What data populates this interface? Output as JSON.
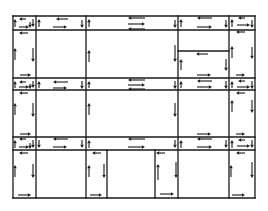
{
  "diagram": {
    "type": "block-circulation-flow",
    "canvas": {
      "width": 268,
      "height": 211,
      "background": "#ffffff",
      "ink": "#1a1a1a"
    },
    "grid": {
      "verticals_x": [
        13,
        36,
        86,
        178,
        229,
        255
      ],
      "horizontals_y": [
        16,
        30,
        78,
        90,
        137,
        150,
        198
      ]
    },
    "walls": [
      {
        "x1": 13,
        "y1": 16,
        "x2": 255,
        "y2": 16
      },
      {
        "x1": 13,
        "y1": 30,
        "x2": 255,
        "y2": 30
      },
      {
        "x1": 13,
        "y1": 78,
        "x2": 255,
        "y2": 78
      },
      {
        "x1": 13,
        "y1": 90,
        "x2": 255,
        "y2": 90
      },
      {
        "x1": 13,
        "y1": 137,
        "x2": 255,
        "y2": 137
      },
      {
        "x1": 13,
        "y1": 150,
        "x2": 255,
        "y2": 150
      },
      {
        "x1": 13,
        "y1": 198,
        "x2": 255,
        "y2": 198
      },
      {
        "x1": 13,
        "y1": 16,
        "x2": 13,
        "y2": 198
      },
      {
        "x1": 36,
        "y1": 16,
        "x2": 36,
        "y2": 198
      },
      {
        "x1": 86,
        "y1": 16,
        "x2": 86,
        "y2": 198
      },
      {
        "x1": 178,
        "y1": 16,
        "x2": 178,
        "y2": 198
      },
      {
        "x1": 229,
        "y1": 16,
        "x2": 229,
        "y2": 198
      },
      {
        "x1": 255,
        "y1": 16,
        "x2": 255,
        "y2": 198
      },
      {
        "x1": 178,
        "y1": 51,
        "x2": 229,
        "y2": 51
      },
      {
        "x1": 107,
        "y1": 150,
        "x2": 107,
        "y2": 198
      },
      {
        "x1": 155,
        "y1": 150,
        "x2": 155,
        "y2": 198
      }
    ],
    "arrows": [
      {
        "x1": 26,
        "y1": 19,
        "x2": 19,
        "y2": 19
      },
      {
        "x1": 19,
        "y1": 27,
        "x2": 29,
        "y2": 27
      },
      {
        "x1": 15,
        "y1": 27,
        "x2": 15,
        "y2": 19
      },
      {
        "x1": 33,
        "y1": 19,
        "x2": 33,
        "y2": 27
      },
      {
        "x1": 30,
        "y1": 22,
        "x2": 30,
        "y2": 28
      },
      {
        "x1": 68,
        "y1": 19,
        "x2": 56,
        "y2": 19
      },
      {
        "x1": 53,
        "y1": 27,
        "x2": 67,
        "y2": 27
      },
      {
        "x1": 39,
        "y1": 27,
        "x2": 39,
        "y2": 19
      },
      {
        "x1": 82,
        "y1": 20,
        "x2": 82,
        "y2": 28
      },
      {
        "x1": 89,
        "y1": 27,
        "x2": 89,
        "y2": 19
      },
      {
        "x1": 145,
        "y1": 18,
        "x2": 128,
        "y2": 18
      },
      {
        "x1": 128,
        "y1": 24,
        "x2": 145,
        "y2": 24
      },
      {
        "x1": 145,
        "y1": 29,
        "x2": 128,
        "y2": 29
      },
      {
        "x1": 175,
        "y1": 20,
        "x2": 175,
        "y2": 28
      },
      {
        "x1": 181,
        "y1": 27,
        "x2": 181,
        "y2": 19
      },
      {
        "x1": 212,
        "y1": 18,
        "x2": 197,
        "y2": 18
      },
      {
        "x1": 197,
        "y1": 27,
        "x2": 212,
        "y2": 27
      },
      {
        "x1": 226,
        "y1": 20,
        "x2": 226,
        "y2": 28
      },
      {
        "x1": 232,
        "y1": 27,
        "x2": 232,
        "y2": 19
      },
      {
        "x1": 245,
        "y1": 18,
        "x2": 238,
        "y2": 18
      },
      {
        "x1": 237,
        "y1": 25,
        "x2": 250,
        "y2": 25
      },
      {
        "x1": 252,
        "y1": 20,
        "x2": 252,
        "y2": 28
      },
      {
        "x1": 28,
        "y1": 33,
        "x2": 19,
        "y2": 33
      },
      {
        "x1": 15,
        "y1": 60,
        "x2": 15,
        "y2": 48
      },
      {
        "x1": 33,
        "y1": 48,
        "x2": 33,
        "y2": 62
      },
      {
        "x1": 20,
        "y1": 75,
        "x2": 31,
        "y2": 75
      },
      {
        "x1": 89,
        "y1": 62,
        "x2": 89,
        "y2": 50
      },
      {
        "x1": 175,
        "y1": 45,
        "x2": 175,
        "y2": 62
      },
      {
        "x1": 181,
        "y1": 70,
        "x2": 181,
        "y2": 59
      },
      {
        "x1": 208,
        "y1": 54,
        "x2": 196,
        "y2": 54
      },
      {
        "x1": 226,
        "y1": 59,
        "x2": 226,
        "y2": 71
      },
      {
        "x1": 232,
        "y1": 58,
        "x2": 232,
        "y2": 46
      },
      {
        "x1": 252,
        "y1": 47,
        "x2": 252,
        "y2": 59
      },
      {
        "x1": 245,
        "y1": 32,
        "x2": 236,
        "y2": 32
      },
      {
        "x1": 197,
        "y1": 75,
        "x2": 211,
        "y2": 75
      },
      {
        "x1": 236,
        "y1": 75,
        "x2": 245,
        "y2": 75
      },
      {
        "x1": 26,
        "y1": 82,
        "x2": 19,
        "y2": 82
      },
      {
        "x1": 19,
        "y1": 87,
        "x2": 29,
        "y2": 87
      },
      {
        "x1": 15,
        "y1": 88,
        "x2": 15,
        "y2": 81
      },
      {
        "x1": 33,
        "y1": 81,
        "x2": 33,
        "y2": 88
      },
      {
        "x1": 30,
        "y1": 84,
        "x2": 30,
        "y2": 89
      },
      {
        "x1": 68,
        "y1": 82,
        "x2": 53,
        "y2": 82
      },
      {
        "x1": 53,
        "y1": 88,
        "x2": 67,
        "y2": 88
      },
      {
        "x1": 39,
        "y1": 88,
        "x2": 39,
        "y2": 81
      },
      {
        "x1": 82,
        "y1": 81,
        "x2": 82,
        "y2": 89
      },
      {
        "x1": 89,
        "y1": 88,
        "x2": 89,
        "y2": 81
      },
      {
        "x1": 145,
        "y1": 80,
        "x2": 128,
        "y2": 80
      },
      {
        "x1": 128,
        "y1": 85,
        "x2": 145,
        "y2": 85
      },
      {
        "x1": 145,
        "y1": 89,
        "x2": 128,
        "y2": 89
      },
      {
        "x1": 175,
        "y1": 81,
        "x2": 175,
        "y2": 89
      },
      {
        "x1": 181,
        "y1": 88,
        "x2": 181,
        "y2": 81
      },
      {
        "x1": 212,
        "y1": 81,
        "x2": 197,
        "y2": 81
      },
      {
        "x1": 197,
        "y1": 87,
        "x2": 212,
        "y2": 87
      },
      {
        "x1": 226,
        "y1": 81,
        "x2": 226,
        "y2": 89
      },
      {
        "x1": 232,
        "y1": 88,
        "x2": 232,
        "y2": 81
      },
      {
        "x1": 245,
        "y1": 81,
        "x2": 238,
        "y2": 81
      },
      {
        "x1": 237,
        "y1": 87,
        "x2": 250,
        "y2": 87
      },
      {
        "x1": 252,
        "y1": 81,
        "x2": 252,
        "y2": 89
      },
      {
        "x1": 28,
        "y1": 93,
        "x2": 19,
        "y2": 93
      },
      {
        "x1": 245,
        "y1": 93,
        "x2": 236,
        "y2": 93
      },
      {
        "x1": 15,
        "y1": 115,
        "x2": 15,
        "y2": 103
      },
      {
        "x1": 33,
        "y1": 103,
        "x2": 33,
        "y2": 117
      },
      {
        "x1": 89,
        "y1": 115,
        "x2": 89,
        "y2": 103
      },
      {
        "x1": 175,
        "y1": 103,
        "x2": 175,
        "y2": 117
      },
      {
        "x1": 232,
        "y1": 112,
        "x2": 232,
        "y2": 100
      },
      {
        "x1": 252,
        "y1": 100,
        "x2": 252,
        "y2": 113
      },
      {
        "x1": 20,
        "y1": 134,
        "x2": 31,
        "y2": 134
      },
      {
        "x1": 197,
        "y1": 134,
        "x2": 211,
        "y2": 134
      },
      {
        "x1": 236,
        "y1": 134,
        "x2": 245,
        "y2": 134
      },
      {
        "x1": 26,
        "y1": 139,
        "x2": 19,
        "y2": 139
      },
      {
        "x1": 19,
        "y1": 147,
        "x2": 29,
        "y2": 147
      },
      {
        "x1": 15,
        "y1": 148,
        "x2": 15,
        "y2": 140
      },
      {
        "x1": 33,
        "y1": 140,
        "x2": 33,
        "y2": 148
      },
      {
        "x1": 30,
        "y1": 143,
        "x2": 30,
        "y2": 149
      },
      {
        "x1": 39,
        "y1": 140,
        "x2": 39,
        "y2": 148
      },
      {
        "x1": 68,
        "y1": 139,
        "x2": 53,
        "y2": 139
      },
      {
        "x1": 53,
        "y1": 147,
        "x2": 67,
        "y2": 147
      },
      {
        "x1": 82,
        "y1": 140,
        "x2": 82,
        "y2": 148
      },
      {
        "x1": 89,
        "y1": 148,
        "x2": 89,
        "y2": 140
      },
      {
        "x1": 145,
        "y1": 139,
        "x2": 128,
        "y2": 139
      },
      {
        "x1": 128,
        "y1": 147,
        "x2": 145,
        "y2": 147
      },
      {
        "x1": 175,
        "y1": 140,
        "x2": 175,
        "y2": 148
      },
      {
        "x1": 181,
        "y1": 148,
        "x2": 181,
        "y2": 140
      },
      {
        "x1": 212,
        "y1": 139,
        "x2": 197,
        "y2": 139
      },
      {
        "x1": 197,
        "y1": 147,
        "x2": 212,
        "y2": 147
      },
      {
        "x1": 226,
        "y1": 140,
        "x2": 226,
        "y2": 148
      },
      {
        "x1": 232,
        "y1": 148,
        "x2": 232,
        "y2": 140
      },
      {
        "x1": 245,
        "y1": 140,
        "x2": 238,
        "y2": 140
      },
      {
        "x1": 237,
        "y1": 146,
        "x2": 250,
        "y2": 146
      },
      {
        "x1": 252,
        "y1": 140,
        "x2": 252,
        "y2": 148
      },
      {
        "x1": 28,
        "y1": 153,
        "x2": 19,
        "y2": 153
      },
      {
        "x1": 101,
        "y1": 153,
        "x2": 92,
        "y2": 153
      },
      {
        "x1": 165,
        "y1": 153,
        "x2": 156,
        "y2": 153
      },
      {
        "x1": 245,
        "y1": 153,
        "x2": 236,
        "y2": 153
      },
      {
        "x1": 15,
        "y1": 177,
        "x2": 15,
        "y2": 165
      },
      {
        "x1": 33,
        "y1": 164,
        "x2": 33,
        "y2": 178
      },
      {
        "x1": 89,
        "y1": 177,
        "x2": 89,
        "y2": 165
      },
      {
        "x1": 104,
        "y1": 164,
        "x2": 104,
        "y2": 178
      },
      {
        "x1": 158,
        "y1": 180,
        "x2": 158,
        "y2": 164
      },
      {
        "x1": 176,
        "y1": 162,
        "x2": 176,
        "y2": 178
      },
      {
        "x1": 231,
        "y1": 177,
        "x2": 231,
        "y2": 165
      },
      {
        "x1": 252,
        "y1": 162,
        "x2": 252,
        "y2": 178
      },
      {
        "x1": 18,
        "y1": 195,
        "x2": 31,
        "y2": 195
      },
      {
        "x1": 90,
        "y1": 195,
        "x2": 102,
        "y2": 195
      },
      {
        "x1": 160,
        "y1": 194,
        "x2": 174,
        "y2": 194
      },
      {
        "x1": 232,
        "y1": 195,
        "x2": 245,
        "y2": 195
      }
    ]
  }
}
